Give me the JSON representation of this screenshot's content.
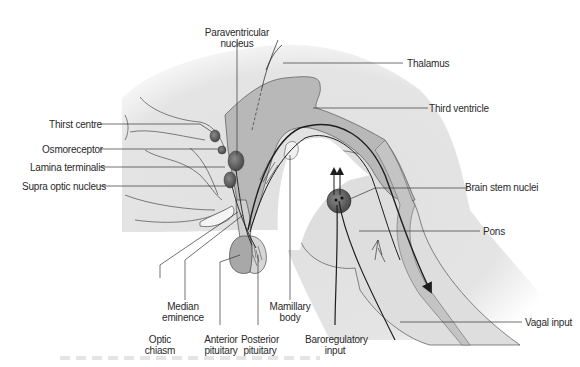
{
  "diagram": {
    "colors": {
      "background": "#ffffff",
      "tissue": "#e2e2e2",
      "ventricle": "#b4b4b4",
      "nucleus": "#6e6e6e",
      "line": "#1e1e1e",
      "label_text": "#2a2a2a"
    },
    "labels": {
      "paraventricular": [
        "Paraventricular",
        "nucleus"
      ],
      "thalamus": "Thalamus",
      "third_ventricle": "Third ventricle",
      "thirst_centre": "Thirst centre",
      "osmoreceptor": "Osmoreceptor",
      "lamina_terminalis": "Lamina terminalis",
      "supra_optic": "Supra optic nucleus",
      "brain_stem_nuclei": "Brain stem nuclei",
      "pons": "Pons",
      "median_eminence": [
        "Median",
        "eminence"
      ],
      "mamillary_body": [
        "Mamillary",
        "body"
      ],
      "optic_chiasm": [
        "Optic",
        "chiasm"
      ],
      "anterior_pituitary": [
        "Anterior",
        "pituitary"
      ],
      "posterior_pituitary": [
        "Posterior",
        "pituitary"
      ],
      "baroregulatory_input": [
        "Baroregulatory",
        "input"
      ],
      "vagal_input": "Vagal input"
    }
  }
}
